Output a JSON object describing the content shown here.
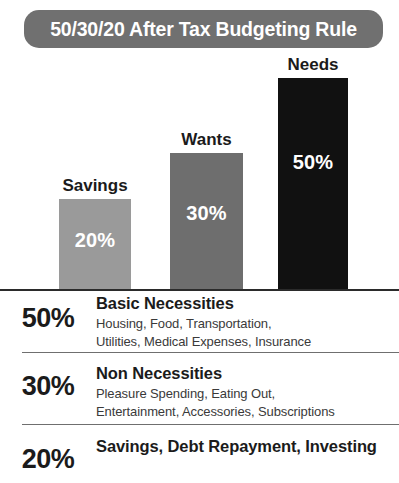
{
  "banner": {
    "title": "50/30/20 After Tax Budgeting Rule",
    "background_color": "#707070",
    "text_color": "#ffffff"
  },
  "chart_data": {
    "type": "bar",
    "title": "50/30/20 After Tax Budgeting Rule",
    "xlabel": "",
    "ylabel": "",
    "ylim": [
      0,
      50
    ],
    "grid": false,
    "legend_position": "below-chart",
    "categories": [
      "Savings",
      "Wants",
      "Needs"
    ],
    "values": [
      20,
      30,
      50
    ],
    "value_labels": [
      "20%",
      "30%",
      "50%"
    ],
    "bar_colors": [
      "#9a9a9a",
      "#6e6e6e",
      "#111111"
    ],
    "baseline_color": "#2b2b2b"
  },
  "legend": {
    "rows": [
      {
        "percent": "50%",
        "title": "Basic Necessities",
        "details": "Housing, Food, Transportation,\nUtilities, Medical Expenses, Insurance",
        "details_line1": "Housing, Food, Transportation,",
        "details_line2": "Utilities, Medical Expenses, Insurance"
      },
      {
        "percent": "30%",
        "title": "Non Necessities",
        "details": "Pleasure Spending, Eating Out,\nEntertainment, Accessories, Subscriptions",
        "details_line1": "Pleasure Spending, Eating Out,",
        "details_line2": "Entertainment, Accessories, Subscriptions"
      },
      {
        "percent": "20%",
        "title": "Savings, Debt Repayment, Investing",
        "details": "",
        "details_line1": "",
        "details_line2": ""
      }
    ]
  }
}
